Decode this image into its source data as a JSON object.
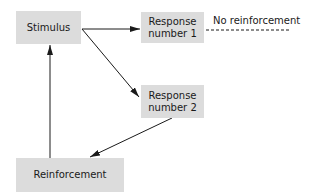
{
  "diagram": {
    "nodes": {
      "stimulus": {
        "label": "Stimulus"
      },
      "response1": {
        "line1": "Response",
        "line2": "number 1"
      },
      "response2": {
        "line1": "Response",
        "line2": "number 2"
      },
      "reinforcement": {
        "label": "Reinforcement"
      }
    },
    "annotations": {
      "no_reinforcement": "No reinforcement"
    },
    "edges": [
      {
        "from": "Stimulus",
        "to": "Response number 1",
        "style": "solid-arrow"
      },
      {
        "from": "Stimulus",
        "to": "Response number 2",
        "style": "solid-arrow"
      },
      {
        "from": "Response number 2",
        "to": "Reinforcement",
        "style": "solid-arrow"
      },
      {
        "from": "Reinforcement",
        "to": "Stimulus",
        "style": "solid-arrow"
      },
      {
        "from": "Response number 1",
        "to": "No reinforcement",
        "style": "dashed"
      }
    ],
    "colors": {
      "box_fill": "#dcdcdc",
      "line": "#1a1a1a",
      "background": "#ffffff"
    }
  }
}
